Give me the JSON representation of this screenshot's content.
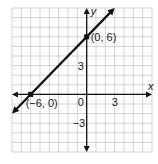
{
  "chart_data": {
    "type": "line",
    "title": "",
    "xlabel": "x",
    "ylabel": "y",
    "xlim": [
      -8,
      7
    ],
    "ylim": [
      -6,
      9
    ],
    "grid": true,
    "x_ticks": [
      {
        "value": 0,
        "label": "0"
      },
      {
        "value": 3,
        "label": "3"
      }
    ],
    "y_ticks": [
      {
        "value": 3,
        "label": "3"
      },
      {
        "value": -3,
        "label": "−3"
      }
    ],
    "series": [
      {
        "name": "y = x + 6",
        "x": [
          -8,
          3
        ],
        "y": [
          -2,
          9
        ],
        "color": "#111111"
      }
    ],
    "points": [
      {
        "x": 0,
        "y": 6,
        "label": "(0, 6)"
      },
      {
        "x": -6,
        "y": 0,
        "label": "(−6, 0)"
      }
    ]
  },
  "colors": {
    "grid": "#c8c8c8",
    "axis": "#111111",
    "line": "#111111"
  }
}
